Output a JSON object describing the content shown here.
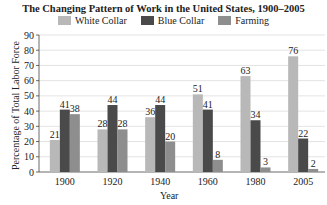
{
  "chart_data": {
    "type": "bar",
    "title": "The Changing Pattern of Work in the United States, 1900–2005",
    "xlabel": "Year",
    "ylabel": "Percentage of Total Labor Force",
    "ylim": [
      0,
      90
    ],
    "yticks": [
      0,
      10,
      20,
      30,
      40,
      50,
      60,
      70,
      80,
      90
    ],
    "grid": true,
    "legend_position": "top",
    "categories": [
      "1900",
      "1920",
      "1940",
      "1960",
      "1980",
      "2005"
    ],
    "series": [
      {
        "name": "White Collar",
        "color": "#b8b8b8",
        "values": [
          21,
          28,
          36,
          51,
          63,
          76
        ]
      },
      {
        "name": "Blue Collar",
        "color": "#4a4a4a",
        "values": [
          41,
          44,
          44,
          41,
          34,
          22
        ]
      },
      {
        "name": "Farming",
        "color": "#8e8e8e",
        "values": [
          38,
          28,
          20,
          8,
          3,
          2
        ]
      }
    ]
  }
}
